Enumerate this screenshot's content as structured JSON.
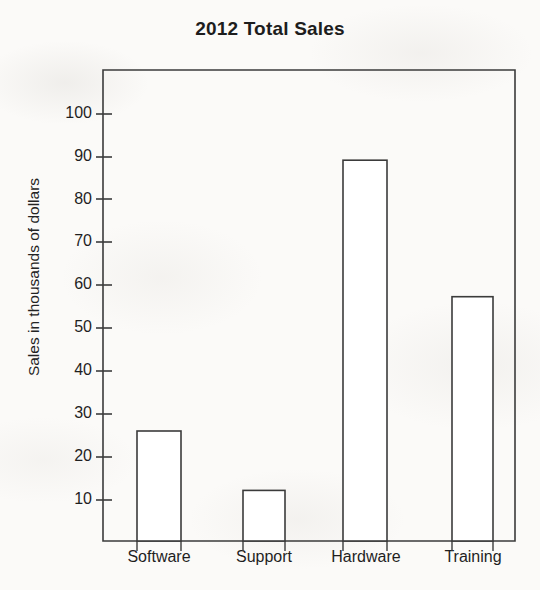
{
  "chart_data": {
    "type": "bar",
    "title": "2012 Total Sales",
    "xlabel": "",
    "ylabel": "Sales in thousands of dollars",
    "categories": [
      "Software",
      "Support",
      "Hardware",
      "Training"
    ],
    "values": [
      25,
      11.5,
      86.5,
      55.5
    ],
    "ylim": [
      0,
      107
    ],
    "ytick_labels": [
      "100",
      "90",
      "80",
      "70",
      "60",
      "50",
      "40",
      "30",
      "20",
      "10"
    ],
    "ytick_values": [
      100,
      90,
      80,
      70,
      60,
      50,
      40,
      30,
      20,
      10
    ],
    "grid": false,
    "legend": null,
    "bar_fill_color": "#ffffff",
    "bar_edge_color": "#3a3a3a",
    "axis_color": "#3a3a3a",
    "background_color": "#fbfaf8",
    "frame": "full-box"
  },
  "labels": {
    "y_tick_0": "100",
    "y_tick_1": "90",
    "y_tick_2": "80",
    "y_tick_3": "70",
    "y_tick_4": "60",
    "y_tick_5": "50",
    "y_tick_6": "40",
    "y_tick_7": "30",
    "y_tick_8": "20",
    "y_tick_9": "10",
    "x_tick_0": "Software",
    "x_tick_1": "Support",
    "x_tick_2": "Hardware",
    "x_tick_3": "Training"
  }
}
